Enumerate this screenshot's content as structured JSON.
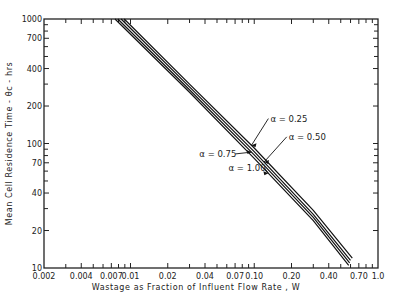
{
  "chart_data": {
    "type": "line",
    "title": "",
    "xlabel": "Wastage as Fraction of Influent Flow Rate , W",
    "ylabel": "Mean Cell Residence Time - θc - hrs",
    "xscale": "log",
    "yscale": "log",
    "xlim": [
      0.002,
      1.0
    ],
    "ylim": [
      10,
      1000
    ],
    "grid": false,
    "xticks_labeled": [
      {
        "value": 0.002,
        "label": "0.002"
      },
      {
        "value": 0.004,
        "label": "0.004"
      },
      {
        "value": 0.007,
        "label": "0.007"
      },
      {
        "value": 0.01,
        "label": "0.01"
      },
      {
        "value": 0.02,
        "label": "0.02"
      },
      {
        "value": 0.04,
        "label": "0.04"
      },
      {
        "value": 0.07,
        "label": "0.07"
      },
      {
        "value": 0.1,
        "label": "0.10"
      },
      {
        "value": 0.2,
        "label": "0.20"
      },
      {
        "value": 0.4,
        "label": "0.40"
      },
      {
        "value": 0.7,
        "label": "0.70"
      },
      {
        "value": 1.0,
        "label": "1.0"
      }
    ],
    "xticks_minor": [
      0.003,
      0.005,
      0.006,
      0.008,
      0.009,
      0.03,
      0.05,
      0.06,
      0.08,
      0.09,
      0.3,
      0.5,
      0.6,
      0.8,
      0.9
    ],
    "yticks_labeled": [
      {
        "value": 10,
        "label": "10"
      },
      {
        "value": 20,
        "label": "20"
      },
      {
        "value": 40,
        "label": "40"
      },
      {
        "value": 70,
        "label": "70"
      },
      {
        "value": 100,
        "label": "100"
      },
      {
        "value": 200,
        "label": "200"
      },
      {
        "value": 400,
        "label": "400"
      },
      {
        "value": 700,
        "label": "700"
      },
      {
        "value": 1000,
        "label": "1000"
      }
    ],
    "yticks_minor": [
      30,
      50,
      60,
      80,
      90,
      300,
      500,
      600,
      800,
      900
    ],
    "series": [
      {
        "name": "α = 0.25",
        "label": "α = 0.25",
        "x": [
          0.0089,
          0.03,
          0.1,
          0.3,
          0.62
        ],
        "y": [
          1000,
          300,
          92,
          29,
          12
        ]
      },
      {
        "name": "α = 0.50",
        "label": "α = 0.50",
        "x": [
          0.0084,
          0.03,
          0.1,
          0.3,
          0.6
        ],
        "y": [
          1000,
          285,
          86,
          27,
          11.5
        ]
      },
      {
        "name": "α = 0.75",
        "label": "α = 0.75",
        "x": [
          0.0079,
          0.03,
          0.1,
          0.3,
          0.59
        ],
        "y": [
          1000,
          270,
          81,
          25.5,
          11
        ]
      },
      {
        "name": "α = 1.00",
        "label": "α = 1.00",
        "x": [
          0.0075,
          0.03,
          0.1,
          0.3,
          0.58
        ],
        "y": [
          1000,
          258,
          76,
          24,
          10.5
        ]
      }
    ],
    "annotations": [
      {
        "text": "α = 0.25",
        "series": "α = 0.25",
        "at_x": 0.095,
        "text_x": 0.135,
        "text_y": 150
      },
      {
        "text": "α = 0.50",
        "series": "α = 0.50",
        "at_x": 0.12,
        "text_x": 0.19,
        "text_y": 107
      },
      {
        "text": "α = 0.75",
        "series": "α = 0.75",
        "at_x": 0.095,
        "text_x": 0.036,
        "text_y": 78
      },
      {
        "text": "α = 1.00",
        "series": "α = 1.00",
        "at_x": 0.13,
        "text_x": 0.062,
        "text_y": 60
      }
    ]
  }
}
